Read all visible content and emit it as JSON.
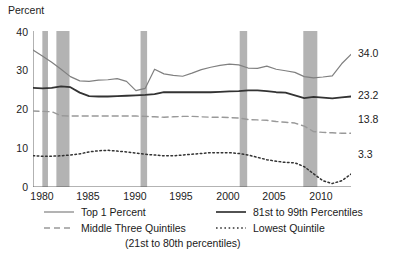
{
  "chart_data": {
    "type": "line",
    "title": "",
    "ylabel": "Percent",
    "xlabel": "",
    "ylim": [
      0,
      40
    ],
    "xlim": [
      1979,
      2013
    ],
    "yticks": [
      "0",
      "10",
      "20",
      "30",
      "40"
    ],
    "xticks": [
      "1980",
      "1985",
      "1990",
      "1995",
      "2000",
      "2005",
      "2010"
    ],
    "grid": false,
    "legend_position": "below",
    "x": [
      1979,
      1980,
      1981,
      1982,
      1983,
      1984,
      1985,
      1986,
      1987,
      1988,
      1989,
      1990,
      1991,
      1992,
      1993,
      1994,
      1995,
      1996,
      1997,
      1998,
      1999,
      2000,
      2001,
      2002,
      2003,
      2004,
      2005,
      2006,
      2007,
      2008,
      2009,
      2010,
      2011,
      2012,
      2013
    ],
    "series": [
      {
        "name": "Top 1 Percent",
        "style": "solid-light",
        "color": "#808080",
        "end_label": "34.0",
        "values": [
          35.1,
          33.6,
          32.0,
          30.2,
          28.3,
          27.2,
          27.1,
          27.4,
          27.5,
          27.8,
          27.1,
          24.7,
          25.3,
          30.2,
          29.0,
          28.6,
          28.4,
          29.2,
          30.1,
          30.7,
          31.2,
          31.5,
          31.3,
          30.5,
          30.4,
          31.0,
          30.2,
          29.8,
          29.4,
          28.3,
          28.0,
          28.2,
          28.5,
          31.6,
          34.0
        ]
      },
      {
        "name": "81st to 99th Percentiles",
        "style": "solid-dark",
        "color": "#333333",
        "end_label": "23.2",
        "values": [
          25.4,
          25.3,
          25.4,
          25.8,
          25.6,
          24.2,
          23.3,
          23.2,
          23.2,
          23.3,
          23.4,
          23.5,
          23.6,
          23.8,
          24.3,
          24.3,
          24.3,
          24.3,
          24.3,
          24.3,
          24.4,
          24.5,
          24.6,
          24.8,
          24.8,
          24.6,
          24.3,
          24.2,
          23.5,
          22.8,
          23.1,
          22.9,
          22.7,
          23.0,
          23.2
        ]
      },
      {
        "name": "Middle Three Quintiles",
        "sublabel": "(21st to 80th percentiles)",
        "style": "dashed",
        "color": "#999999",
        "end_label": "13.8",
        "values": [
          19.5,
          19.4,
          19.3,
          18.3,
          18.2,
          18.2,
          18.2,
          18.2,
          18.2,
          18.2,
          18.2,
          18.2,
          18.1,
          18.0,
          17.9,
          18.0,
          18.1,
          18.1,
          18.0,
          17.9,
          17.9,
          17.8,
          17.7,
          17.3,
          17.2,
          17.1,
          16.8,
          16.6,
          16.4,
          15.6,
          14.2,
          14.0,
          13.9,
          13.8,
          13.8
        ]
      },
      {
        "name": "Lowest Quintile",
        "style": "dotted",
        "color": "#333333",
        "end_label": "3.3",
        "values": [
          8.0,
          7.9,
          7.9,
          8.0,
          8.2,
          8.5,
          9.0,
          9.3,
          9.4,
          9.2,
          9.0,
          8.7,
          8.4,
          8.2,
          8.0,
          8.0,
          8.2,
          8.4,
          8.6,
          8.8,
          8.8,
          8.8,
          8.6,
          8.2,
          7.6,
          7.0,
          6.6,
          6.3,
          6.2,
          5.2,
          3.4,
          1.6,
          0.9,
          1.6,
          3.3
        ]
      }
    ],
    "recession_bands": [
      {
        "start": 1980.0,
        "end": 1980.6
      },
      {
        "start": 1981.5,
        "end": 1982.9
      },
      {
        "start": 1990.5,
        "end": 1991.2
      },
      {
        "start": 2001.1,
        "end": 2001.9
      },
      {
        "start": 2007.9,
        "end": 2009.4
      }
    ],
    "recession_band_color": "#b3b3b3"
  },
  "legend": {
    "items": [
      {
        "label": "Top 1 Percent"
      },
      {
        "label": "81st to 99th Percentiles"
      },
      {
        "label": "Middle Three Quintiles"
      },
      {
        "label": "Lowest Quintile"
      },
      {
        "label": "(21st to 80th percentiles)"
      }
    ]
  }
}
